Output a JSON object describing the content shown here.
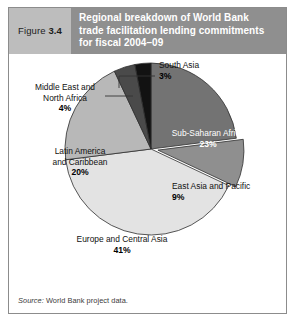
{
  "figure": {
    "number_prefix": "Figure",
    "number": "3.4",
    "title_lines": [
      "Regional breakdown of World Bank",
      "trade facilitation lending commitments",
      "for fiscal 2004–09"
    ],
    "source_prefix": "Source:",
    "source_text": "World Bank project data."
  },
  "colors": {
    "header_figno_bg": "#bdbdbd",
    "header_title_bg": "#8f8f8f",
    "header_title_text": "#ffffff",
    "frame_border": "#8c8c8c",
    "background": "#ffffff"
  },
  "chart_data": {
    "type": "pie",
    "title": "Regional breakdown of World Bank trade facilitation lending commitments for fiscal 2004–09",
    "xlabel": "",
    "ylabel": "",
    "legend_position": "none",
    "labels_inside": true,
    "start_angle_deg": 0,
    "direction": "clockwise",
    "categories": [
      "Sub-Saharan Africa",
      "East Asia and Pacific",
      "Europe and Central Asia",
      "Latin America and Caribbean",
      "Middle East and North Africa",
      "South Asia"
    ],
    "values": [
      23,
      9,
      41,
      20,
      4,
      3
    ],
    "unit": "percent",
    "total": 100,
    "slices": [
      {
        "name": "Sub-Saharan Africa",
        "value": 23,
        "value_label": "23%",
        "label_lines": [
          "Sub-Saharan Africa"
        ],
        "color": "#737373",
        "text_color": "#ffffff",
        "exploded": false,
        "leader_line": false
      },
      {
        "name": "East Asia and Pacific",
        "value": 9,
        "value_label": "9%",
        "label_lines": [
          "East Asia and Pacific"
        ],
        "color": "#8f8f8f",
        "text_color": "#111111",
        "exploded": true,
        "leader_line": false
      },
      {
        "name": "Europe and Central Asia",
        "value": 41,
        "value_label": "41%",
        "label_lines": [
          "Europe and Central Asia"
        ],
        "color": "#e3e3e3",
        "text_color": "#111111",
        "exploded": false,
        "leader_line": false
      },
      {
        "name": "Latin America and Caribbean",
        "value": 20,
        "value_label": "20%",
        "label_lines": [
          "Latin America",
          "and Caribbean"
        ],
        "color": "#b8b8b8",
        "text_color": "#111111",
        "exploded": false,
        "leader_line": false
      },
      {
        "name": "Middle East and North Africa",
        "value": 4,
        "value_label": "4%",
        "label_lines": [
          "Middle East and",
          "North Africa"
        ],
        "color": "#4a4a4a",
        "text_color": "#111111",
        "exploded": false,
        "leader_line": true
      },
      {
        "name": "South Asia",
        "value": 3,
        "value_label": "3%",
        "label_lines": [
          "South Asia"
        ],
        "color": "#121212",
        "text_color": "#111111",
        "exploded": false,
        "leader_line": true
      }
    ]
  }
}
